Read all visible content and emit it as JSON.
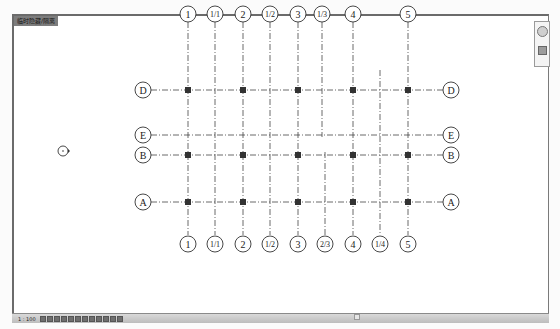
{
  "view_tab": {
    "label": "临时隐藏/隔离"
  },
  "status_bar": {
    "scale": "1 : 100",
    "icons": [
      "detail-level-icon",
      "visual-style-icon",
      "sun-path-icon",
      "shadows-icon",
      "crop-view-icon",
      "show-crop-icon",
      "temp-hide-icon",
      "reveal-hidden-icon",
      "lock-3d-icon",
      "analysis-icon",
      "highlight-icon",
      "constraints-icon"
    ]
  },
  "navigation_bar": {
    "items": [
      "steering-wheel-icon",
      "zoom-icon"
    ]
  },
  "grid": {
    "columns_top": [
      {
        "label": "1",
        "x": 188
      },
      {
        "label": "1/1",
        "x": 215
      },
      {
        "label": "2",
        "x": 243
      },
      {
        "label": "1/2",
        "x": 270
      },
      {
        "label": "3",
        "x": 298
      },
      {
        "label": "1/3",
        "x": 322
      },
      {
        "label": "4",
        "x": 353
      },
      {
        "label": "5",
        "x": 408
      }
    ],
    "columns_bottom": [
      {
        "label": "1",
        "x": 188
      },
      {
        "label": "1/1",
        "x": 215
      },
      {
        "label": "2",
        "x": 243
      },
      {
        "label": "1/2",
        "x": 270
      },
      {
        "label": "3",
        "x": 298
      },
      {
        "label": "2/3",
        "x": 325
      },
      {
        "label": "4",
        "x": 353
      },
      {
        "label": "1/4",
        "x": 380
      },
      {
        "label": "5",
        "x": 408
      }
    ],
    "rows": [
      {
        "label": "D",
        "y": 90
      },
      {
        "label": "E",
        "y": 135
      },
      {
        "label": "B",
        "y": 155
      },
      {
        "label": "A",
        "y": 202
      }
    ]
  },
  "colors": {
    "grid_line": "#444444",
    "bubble_stroke": "#333333",
    "column_node": "#333333"
  }
}
